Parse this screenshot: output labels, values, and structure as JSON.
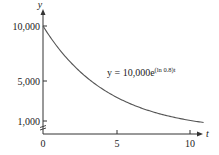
{
  "chart_data": {
    "type": "line",
    "title": "",
    "xlabel": "t",
    "ylabel": "y",
    "xlim": [
      0,
      11
    ],
    "ylim": [
      0,
      10000
    ],
    "x_ticks": [
      0,
      5,
      10
    ],
    "x_tick_labels": [
      "0",
      "5",
      "10"
    ],
    "y_ticks": [
      1000,
      5000,
      10000
    ],
    "y_tick_labels": [
      "1,000",
      "5,000",
      "10,000"
    ],
    "grid": false,
    "legend": null,
    "axis_break": "y-axis break between 0 and 1,000",
    "series": [
      {
        "name": "y = 10,000e^((ln 0.8)t)",
        "x": [
          0,
          1,
          2,
          3,
          4,
          5,
          6,
          7,
          8,
          9,
          10,
          11
        ],
        "y": [
          10000,
          8000,
          6400,
          5120,
          4096,
          3277,
          2621,
          2097,
          1678,
          1342,
          1074,
          859
        ],
        "color": "#555555"
      }
    ],
    "annotations": [
      {
        "text_base": "y = 10,000e",
        "text_exp": "(ln 0.8)t",
        "position": "right of curve near y=5,000"
      }
    ]
  },
  "labels": {
    "y_axis": "y",
    "x_axis": "t",
    "tick_10000": "10,000",
    "tick_5000": "5,000",
    "tick_1000": "1,000",
    "tick_0": "0",
    "tick_5": "5",
    "tick_10": "10",
    "eq_base": "y = 10,000e",
    "eq_exp": "(ln 0.8)t"
  }
}
